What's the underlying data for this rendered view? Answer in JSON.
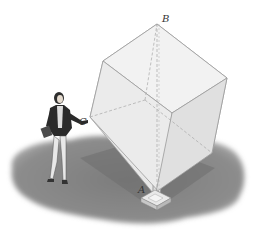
{
  "figure": {
    "labels": {
      "top_vertex": "B",
      "left_vertex": "C",
      "bottom_vertex": "A"
    },
    "colors": {
      "background": "#ffffff",
      "shadow": "#8a8a8a",
      "shadow_inner": "#7a7a7a",
      "cube_face_light": "#f0f0f0",
      "cube_face_mid": "#e2e2e2",
      "cube_face_dark": "#d4d4d4",
      "cube_edge": "#9a9a9a",
      "hidden_edge": "#a8a8a8",
      "pedestal": "#dcdcdc",
      "label": "#333333",
      "figure_jacket": "#2a2a2a",
      "figure_pants": "#e6e6e6"
    }
  }
}
